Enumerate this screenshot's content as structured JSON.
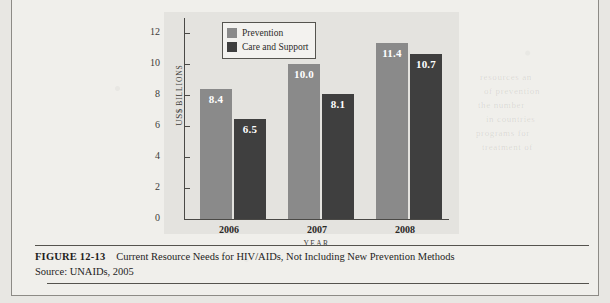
{
  "figure": {
    "number": "FIGURE 12-13",
    "title": "Current Resource Needs for HIV/AIDs, Not Including New Prevention Methods",
    "source": "Source: UNAIDs, 2005"
  },
  "chart_data": {
    "type": "bar",
    "title": "",
    "xlabel": "YEAR",
    "ylabel": "US$ BILLIONS",
    "ylabel_parts": {
      "main": "US$",
      "small": "BILLIONS"
    },
    "categories": [
      "2006",
      "2007",
      "2008"
    ],
    "series": [
      {
        "name": "Prevention",
        "color": "#8a8a8a",
        "values": [
          8.4,
          10.0,
          11.4
        ],
        "labels": [
          "8.4",
          "10.0",
          "11.4"
        ]
      },
      {
        "name": "Care and Support",
        "color": "#3f3f3f",
        "values": [
          6.5,
          8.1,
          10.7
        ],
        "labels": [
          "6.5",
          "8.1",
          "10.7"
        ]
      }
    ],
    "ylim": [
      0,
      13
    ],
    "yticks": [
      0,
      2,
      4,
      6,
      8,
      10,
      12
    ],
    "ytick_labels": [
      "0",
      "2",
      "4",
      "6",
      "8",
      "10",
      "12"
    ],
    "grid": false,
    "legend_position": "top-left-inside"
  },
  "ghost_text": [
    "resources an",
    "of prevention",
    "the number",
    "in countries",
    "programs for",
    "treatment of"
  ]
}
